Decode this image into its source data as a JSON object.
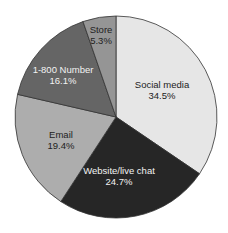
{
  "chart_data": {
    "type": "pie",
    "title": "",
    "start_angle": "12 o'clock",
    "direction": "clockwise",
    "slices": [
      {
        "label": "Social media",
        "value": 34.5,
        "display": "34.5%",
        "color": "#e6e6e6",
        "text_color": "#222222",
        "label_pos": [
          162,
          90
        ]
      },
      {
        "label": "Website/live chat",
        "value": 24.7,
        "display": "24.7%",
        "color": "#262626",
        "text_color": "#f2f2f2",
        "label_pos": [
          119,
          176
        ]
      },
      {
        "label": "Email",
        "value": 19.4,
        "display": "19.4%",
        "color": "#adadad",
        "text_color": "#222222",
        "label_pos": [
          61,
          140
        ]
      },
      {
        "label": "1-800 Number",
        "value": 16.1,
        "display": "16.1%",
        "color": "#656565",
        "text_color": "#f2f2f2",
        "label_pos": [
          63,
          75
        ]
      },
      {
        "label": "Store",
        "value": 5.3,
        "display": "5.3%",
        "color": "#959595",
        "text_color": "#222222",
        "label_pos": [
          101,
          35
        ]
      }
    ],
    "legend": null
  }
}
